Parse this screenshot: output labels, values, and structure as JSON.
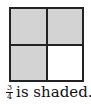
{
  "figure": {
    "grid": {
      "rows": 2,
      "cols": 2,
      "cells": [
        {
          "position": "top-left",
          "shaded": true
        },
        {
          "position": "top-right",
          "shaded": true
        },
        {
          "position": "bottom-left",
          "shaded": true
        },
        {
          "position": "bottom-right",
          "shaded": false
        }
      ],
      "shade_color": "#d3d3d3",
      "unshaded_color": "#ffffff",
      "border_color": "#222222"
    },
    "caption": {
      "fraction_numerator": "3",
      "fraction_denominator": "4",
      "text": "is shaded."
    }
  }
}
